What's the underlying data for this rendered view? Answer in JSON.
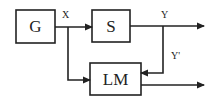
{
  "diagram": {
    "blocks": [
      {
        "id": "G",
        "label": "G"
      },
      {
        "id": "S",
        "label": "S"
      },
      {
        "id": "LM",
        "label": "LM"
      }
    ],
    "signals": {
      "x": "X",
      "y": "Y",
      "y_prime": "Y'"
    },
    "edges": [
      {
        "from": "G",
        "to": "S",
        "label": "X"
      },
      {
        "from": "X-junction",
        "to": "LM"
      },
      {
        "from": "S",
        "to": "output",
        "label": "Y"
      },
      {
        "from": "Y-junction",
        "to": "LM",
        "label": "Y'"
      },
      {
        "from": "LM",
        "to": "output"
      }
    ]
  }
}
